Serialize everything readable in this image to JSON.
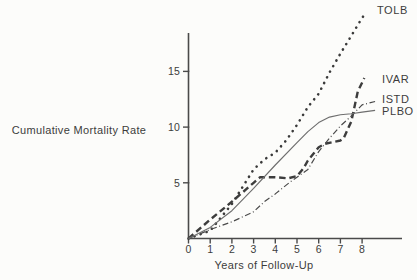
{
  "figure": {
    "background": "#fcfcfa",
    "ink_color": "#3c3c3c",
    "axis_color": "#4a4a4a",
    "solid_line_color": "#6e6e6e"
  },
  "chart_data": {
    "type": "line",
    "title": "",
    "xlabel": "Years of Follow-Up",
    "ylabel": "Cumulative Mortality Rate",
    "xlim": [
      0,
      9.8
    ],
    "ylim": [
      0,
      18.4
    ],
    "x_ticks": [
      0,
      1,
      2,
      3,
      4,
      5,
      6,
      7,
      8
    ],
    "y_ticks": [
      5,
      10,
      15
    ],
    "grid": false,
    "legend_position": "right-end-labels",
    "series": [
      {
        "name": "TOLB",
        "style": "dotted",
        "x": [
          0,
          1,
          2,
          3,
          3.5,
          4,
          4.5,
          5,
          5.5,
          6,
          6.5,
          7,
          7.5,
          8,
          8.2
        ],
        "y": [
          0,
          0.7,
          3.1,
          6.2,
          7.1,
          7.7,
          8.8,
          10.2,
          11.8,
          13.0,
          14.9,
          16.6,
          18.2,
          19.8,
          20.3
        ]
      },
      {
        "name": "IVAR",
        "style": "heavy-dash",
        "x": [
          0,
          1,
          2,
          3,
          3.3,
          4,
          4.6,
          5,
          5.3,
          5.5,
          6,
          6.3,
          7,
          7.15,
          7.5,
          7.8,
          8.1
        ],
        "y": [
          0,
          1.7,
          3.3,
          5.0,
          5.5,
          5.5,
          5.4,
          5.6,
          6.3,
          7.0,
          8.2,
          8.5,
          8.8,
          9.0,
          10.5,
          13.2,
          14.4
        ]
      },
      {
        "name": "ISTD",
        "style": "dash-dot",
        "x": [
          0,
          1,
          2,
          3,
          3.5,
          4,
          4.7,
          5,
          5.5,
          6,
          6.5,
          7,
          7.5,
          8,
          8.6
        ],
        "y": [
          0,
          0.8,
          1.5,
          2.4,
          3.3,
          4.0,
          5.1,
          5.5,
          6.2,
          7.8,
          9.0,
          10.1,
          11.0,
          12.0,
          12.3
        ]
      },
      {
        "name": "PLBO",
        "style": "solid",
        "x": [
          0,
          1,
          2,
          3,
          4,
          5,
          5.5,
          6,
          6.5,
          7,
          7.5,
          8,
          8.6
        ],
        "y": [
          0,
          1.0,
          2.5,
          4.5,
          6.6,
          8.6,
          9.6,
          10.4,
          10.9,
          11.1,
          11.2,
          11.35,
          11.5
        ]
      }
    ]
  }
}
